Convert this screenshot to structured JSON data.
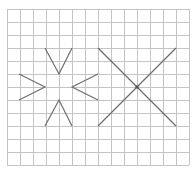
{
  "diagram": {
    "colors": {
      "background": "#ffffff",
      "grid": "#c4c4c4",
      "stroke": "#6e6e6e",
      "dot": "#555555"
    },
    "grid": {
      "x0": 7,
      "y0": 9,
      "cell": 13,
      "cols": 14,
      "rows": 12
    },
    "figures": [
      {
        "name": "left-converging-strokes",
        "polylines": [
          [
            [
              45,
              48
            ],
            [
              59,
              74
            ],
            [
              72,
              48
            ]
          ],
          [
            [
              19,
              74
            ],
            [
              45,
              87
            ],
            [
              19,
              100
            ]
          ],
          [
            [
              98,
              74
            ],
            [
              72,
              87
            ],
            [
              98,
              100
            ]
          ],
          [
            [
              45,
              126
            ],
            [
              59,
              100
            ],
            [
              72,
              126
            ]
          ]
        ],
        "center_dot": null
      },
      {
        "name": "right-x-shape",
        "polylines": [
          [
            [
              98,
              48
            ],
            [
              176,
              126
            ]
          ],
          [
            [
              176,
              48
            ],
            [
              98,
              126
            ]
          ]
        ],
        "center_dot": [
          137,
          87
        ]
      }
    ]
  }
}
